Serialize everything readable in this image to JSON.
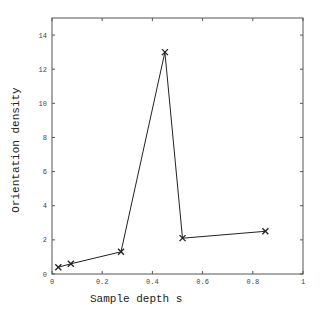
{
  "chart_data": {
    "type": "line",
    "title": "",
    "xlabel": "Sample depth s",
    "ylabel": "Orientation density",
    "xlim": [
      0,
      1
    ],
    "ylim": [
      0,
      15
    ],
    "x_ticks": [
      0,
      0.2,
      0.4,
      0.6,
      0.8,
      1
    ],
    "x_tick_labels": [
      "0",
      "0.2",
      "0.4",
      "0.6",
      "0.8",
      "1"
    ],
    "y_ticks": [
      0,
      2,
      4,
      6,
      8,
      10,
      12,
      14
    ],
    "y_tick_labels": [
      "0",
      "2",
      "4",
      "6",
      "8",
      "10",
      "12",
      "14"
    ],
    "grid": false,
    "legend": null,
    "series": [
      {
        "name": "Orientation density",
        "marker": "x",
        "color": "#222222",
        "x": [
          0.025,
          0.075,
          0.275,
          0.45,
          0.52,
          0.85
        ],
        "y": [
          0.4,
          0.6,
          1.3,
          13.0,
          2.1,
          2.5
        ]
      }
    ]
  }
}
